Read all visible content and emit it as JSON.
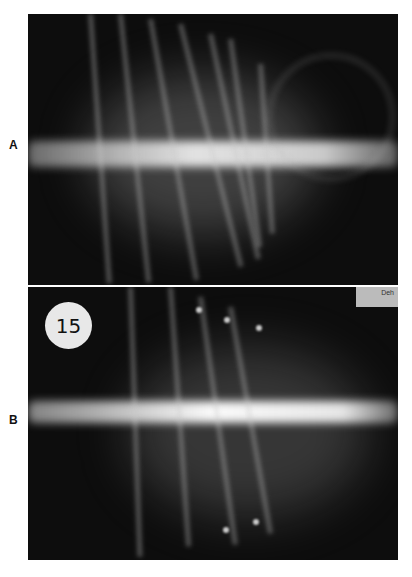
{
  "figure": {
    "panels": [
      {
        "label": "A",
        "description": "Radiograph of ribcage and spine, ventrodorsal view"
      },
      {
        "label": "B",
        "description": "Radiograph of ribcage and spine, ventrodorsal view with numbered marker",
        "marker_text": "15",
        "corner_tag_text": "Deh"
      }
    ]
  }
}
